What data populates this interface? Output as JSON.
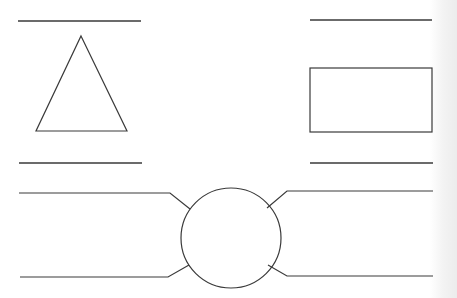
{
  "diagram": {
    "stroke_color": "#3a3a3a",
    "background_color": "#ffffff",
    "shapes": {
      "triangle": {
        "apex": [
          81,
          36
        ],
        "base_left": [
          36,
          131
        ],
        "base_right": [
          127,
          131
        ]
      },
      "rectangle": {
        "x": 310,
        "y": 68,
        "width": 122,
        "height": 64
      },
      "circle": {
        "cx": 231,
        "cy": 238,
        "r": 50
      }
    },
    "label_lines": [
      {
        "id": "top-left",
        "x1": 18,
        "y1": 21,
        "x2": 141,
        "y2": 21
      },
      {
        "id": "top-right",
        "x1": 310,
        "y1": 20,
        "x2": 432,
        "y2": 20
      },
      {
        "id": "mid-left",
        "x1": 19,
        "y1": 163,
        "x2": 142,
        "y2": 163
      },
      {
        "id": "mid-right",
        "x1": 310,
        "y1": 163,
        "x2": 433,
        "y2": 163
      }
    ],
    "connectors": [
      {
        "id": "upper-left",
        "points": [
          [
            19,
            193
          ],
          [
            170,
            193
          ],
          [
            190,
            209
          ]
        ]
      },
      {
        "id": "lower-left",
        "points": [
          [
            20,
            277
          ],
          [
            168,
            277
          ],
          [
            189,
            265
          ]
        ]
      },
      {
        "id": "upper-right",
        "points": [
          [
            433,
            191
          ],
          [
            287,
            191
          ],
          [
            267,
            208
          ]
        ]
      },
      {
        "id": "lower-right",
        "points": [
          [
            433,
            276
          ],
          [
            287,
            276
          ],
          [
            268,
            265
          ]
        ]
      }
    ]
  }
}
